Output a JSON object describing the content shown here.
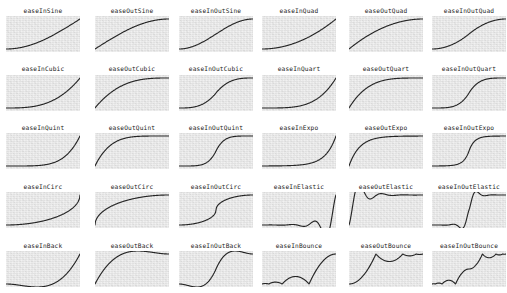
{
  "page": {
    "background_color": "#ffffff",
    "width": 507,
    "height": 293
  },
  "grid": {
    "columns": 6,
    "rows": 5,
    "cell_width": 74,
    "cell_height": 36,
    "label_height": 9,
    "col_x": [
      6,
      95,
      179,
      262,
      349,
      432
    ],
    "row_label_y": [
      7,
      65,
      124,
      183,
      242
    ],
    "row_plot_y": [
      16,
      75,
      133,
      192,
      251
    ]
  },
  "style": {
    "plot_background": "#e7e7e7",
    "curve_color": "#262626",
    "label_color": "#1c1c1c",
    "curve_stroke_width": 1.15,
    "label_font_size": "6.2px"
  },
  "chart_data": {
    "type": "line",
    "xlabel": "",
    "ylabel": "",
    "xlim": [
      0,
      1
    ],
    "ylim": [
      0,
      1
    ],
    "grid": false,
    "legend": "none",
    "panels": [
      {
        "row": 0,
        "col": 0,
        "label": "easeInSine",
        "fn": "inSine"
      },
      {
        "row": 0,
        "col": 1,
        "label": "easeOutSine",
        "fn": "outSine"
      },
      {
        "row": 0,
        "col": 2,
        "label": "easeInOutSine",
        "fn": "inOutSine"
      },
      {
        "row": 0,
        "col": 3,
        "label": "easeInQuad",
        "fn": "inQuad"
      },
      {
        "row": 0,
        "col": 4,
        "label": "easeOutQuad",
        "fn": "outQuad"
      },
      {
        "row": 0,
        "col": 5,
        "label": "easeInOutQuad",
        "fn": "inOutQuad"
      },
      {
        "row": 1,
        "col": 0,
        "label": "easeInCubic",
        "fn": "inCubic"
      },
      {
        "row": 1,
        "col": 1,
        "label": "easeOutCubic",
        "fn": "outCubic"
      },
      {
        "row": 1,
        "col": 2,
        "label": "easeInOutCubic",
        "fn": "inOutCubic"
      },
      {
        "row": 1,
        "col": 3,
        "label": "easeInQuart",
        "fn": "inQuart"
      },
      {
        "row": 1,
        "col": 4,
        "label": "easeOutQuart",
        "fn": "outQuart"
      },
      {
        "row": 1,
        "col": 5,
        "label": "easeInOutQuart",
        "fn": "inOutQuart"
      },
      {
        "row": 2,
        "col": 0,
        "label": "easeInQuint",
        "fn": "inQuint"
      },
      {
        "row": 2,
        "col": 1,
        "label": "easeOutQuint",
        "fn": "outQuint"
      },
      {
        "row": 2,
        "col": 2,
        "label": "easeInOutQuint",
        "fn": "inOutQuint"
      },
      {
        "row": 2,
        "col": 3,
        "label": "easeInExpo",
        "fn": "inExpo"
      },
      {
        "row": 2,
        "col": 4,
        "label": "easeOutExpo",
        "fn": "outExpo"
      },
      {
        "row": 2,
        "col": 5,
        "label": "easeInOutExpo",
        "fn": "inOutExpo"
      },
      {
        "row": 3,
        "col": 0,
        "label": "easeInCirc",
        "fn": "inCirc"
      },
      {
        "row": 3,
        "col": 1,
        "label": "easeOutCirc",
        "fn": "outCirc"
      },
      {
        "row": 3,
        "col": 2,
        "label": "easeInOutCirc",
        "fn": "inOutCirc"
      },
      {
        "row": 3,
        "col": 3,
        "label": "easeInElastic",
        "fn": "inElastic"
      },
      {
        "row": 3,
        "col": 4,
        "label": "easeOutElastic",
        "fn": "outElastic"
      },
      {
        "row": 3,
        "col": 5,
        "label": "easeInOutElastic",
        "fn": "inOutElastic"
      },
      {
        "row": 4,
        "col": 0,
        "label": "easeInBack",
        "fn": "inBack"
      },
      {
        "row": 4,
        "col": 1,
        "label": "easeOutBack",
        "fn": "outBack"
      },
      {
        "row": 4,
        "col": 2,
        "label": "easeInOutBack",
        "fn": "inOutBack"
      },
      {
        "row": 4,
        "col": 3,
        "label": "easeInBounce",
        "fn": "inBounce"
      },
      {
        "row": 4,
        "col": 4,
        "label": "easeOutBounce",
        "fn": "outBounce"
      },
      {
        "row": 4,
        "col": 5,
        "label": "easeInOutBounce",
        "fn": "inOutBounce"
      }
    ]
  }
}
